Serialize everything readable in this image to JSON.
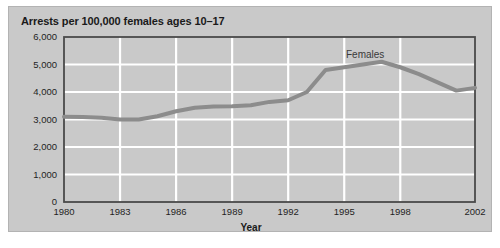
{
  "figure": {
    "title": "Arrests per 100,000 females ages 10–17",
    "background_color": "#c9c9c9",
    "border_color": "#b3b3b3"
  },
  "axis": {
    "x_title": "Year",
    "y_title": "",
    "gridline_color": "#ffffff",
    "frame_color": "#4a4a4a"
  },
  "series_label": {
    "females": "Females"
  },
  "chart_data": {
    "type": "line",
    "title": "Arrests per 100,000 females ages 10–17",
    "subtitle": "",
    "xlabel": "Year",
    "ylabel": "",
    "xlim": [
      1980,
      2002
    ],
    "ylim": [
      0,
      6000
    ],
    "grid": true,
    "legend_position": "inline-annotation",
    "annotations": [
      {
        "text": "Females",
        "x": 1995.0,
        "y": 5600
      }
    ],
    "xticks": [
      1980,
      1983,
      1986,
      1989,
      1992,
      1995,
      1998,
      2002
    ],
    "xticklabels": [
      "1980",
      "1983",
      "1986",
      "1989",
      "1992",
      "1995",
      "1998",
      "2002"
    ],
    "yticks": [
      0,
      1000,
      2000,
      3000,
      4000,
      5000,
      6000
    ],
    "yticklabels": [
      "0",
      "1,000",
      "2,000",
      "3,000",
      "4,000",
      "5,000",
      "6,000"
    ],
    "series": [
      {
        "name": "Females",
        "color": "#8c8c8c",
        "line_width": 4,
        "x": [
          1980,
          1981,
          1982,
          1983,
          1984,
          1985,
          1986,
          1987,
          1988,
          1989,
          1990,
          1991,
          1992,
          1993,
          1994,
          1995,
          1996,
          1997,
          1998,
          1999,
          2000,
          2001,
          2002
        ],
        "values": [
          3100,
          3090,
          3060,
          3000,
          3000,
          3120,
          3300,
          3430,
          3470,
          3480,
          3520,
          3640,
          3700,
          4000,
          4800,
          4900,
          5000,
          5100,
          4900,
          4650,
          4350,
          4050,
          4150
        ]
      }
    ]
  }
}
